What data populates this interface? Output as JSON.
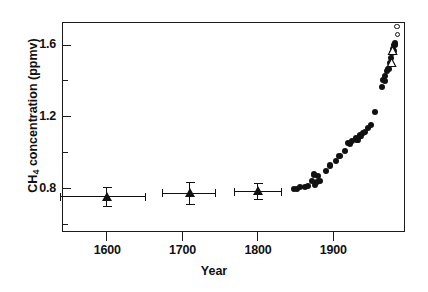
{
  "chart_data": {
    "type": "scatter",
    "title": "",
    "xlabel": "Year",
    "ylabel": "CH4 concentration (ppmv)",
    "ylabel_prefix": "CH",
    "ylabel_subscript": "4",
    "ylabel_suffix": " concentration (ppmv)",
    "xlim": [
      1540,
      1995
    ],
    "ylim": [
      0.56,
      1.73
    ],
    "grid": false,
    "legend": "none",
    "x_major_ticks": [
      1600,
      1700,
      1800,
      1900
    ],
    "x_tick_labels": [
      "1600",
      "1700",
      "1800",
      "1900"
    ],
    "y_major_ticks": [
      0.8,
      1.2,
      1.6
    ],
    "y_tick_labels": [
      "0.8",
      "1.2",
      "1.6"
    ],
    "y_minor_ticks": [
      0.6,
      1.0,
      1.4
    ],
    "axis_color": "#1b1b1b",
    "marker_color": "#111111",
    "background": "#ffffff",
    "series": [
      {
        "name": "ice-core-samples",
        "marker": "filled-triangle",
        "points": [
          {
            "x": 1600,
            "y": 0.755,
            "xerr_low": 62,
            "xerr_high": 51,
            "yerr_low": 0.052,
            "yerr_high": 0.052
          },
          {
            "x": 1710,
            "y": 0.775,
            "xerr_low": 37,
            "xerr_high": 34,
            "yerr_low": 0.062,
            "yerr_high": 0.062
          },
          {
            "x": 1800,
            "y": 0.785,
            "xerr_low": 31,
            "xerr_high": 31,
            "yerr_low": 0.044,
            "yerr_high": 0.044
          }
        ]
      },
      {
        "name": "ice-core-and-atmospheric-record",
        "marker": "filled-circle",
        "points": [
          {
            "x": 1848,
            "y": 0.8
          },
          {
            "x": 1852,
            "y": 0.798
          },
          {
            "x": 1856,
            "y": 0.81
          },
          {
            "x": 1862,
            "y": 0.812
          },
          {
            "x": 1866,
            "y": 0.818
          },
          {
            "x": 1872,
            "y": 0.845
          },
          {
            "x": 1874,
            "y": 0.88
          },
          {
            "x": 1876,
            "y": 0.822
          },
          {
            "x": 1878,
            "y": 0.838
          },
          {
            "x": 1880,
            "y": 0.87
          },
          {
            "x": 1882,
            "y": 0.845
          },
          {
            "x": 1890,
            "y": 0.9
          },
          {
            "x": 1896,
            "y": 0.93
          },
          {
            "x": 1903,
            "y": 0.955
          },
          {
            "x": 1908,
            "y": 0.985
          },
          {
            "x": 1915,
            "y": 1.01
          },
          {
            "x": 1919,
            "y": 1.055
          },
          {
            "x": 1922,
            "y": 1.048
          },
          {
            "x": 1925,
            "y": 1.068
          },
          {
            "x": 1930,
            "y": 1.085
          },
          {
            "x": 1932,
            "y": 1.075
          },
          {
            "x": 1936,
            "y": 1.098
          },
          {
            "x": 1939,
            "y": 1.11
          },
          {
            "x": 1942,
            "y": 1.118
          },
          {
            "x": 1946,
            "y": 1.14
          },
          {
            "x": 1950,
            "y": 1.155
          },
          {
            "x": 1955,
            "y": 1.23
          },
          {
            "x": 1964,
            "y": 1.37
          },
          {
            "x": 1966,
            "y": 1.405
          },
          {
            "x": 1968,
            "y": 1.4
          },
          {
            "x": 1969,
            "y": 1.43
          },
          {
            "x": 1971,
            "y": 1.455
          },
          {
            "x": 1973,
            "y": 1.47
          },
          {
            "x": 1975,
            "y": 1.5
          },
          {
            "x": 1976,
            "y": 1.53
          },
          {
            "x": 1978,
            "y": 1.555
          },
          {
            "x": 1979,
            "y": 1.58
          },
          {
            "x": 1980,
            "y": 1.57
          },
          {
            "x": 1981,
            "y": 1.6
          },
          {
            "x": 1982,
            "y": 1.61
          }
        ]
      },
      {
        "name": "open-triangle-samples",
        "marker": "open-triangle",
        "points": [
          {
            "x": 1977,
            "y": 1.505
          },
          {
            "x": 1978,
            "y": 1.57
          }
        ]
      },
      {
        "name": "modern-atmospheric-measurements",
        "marker": "open-circle",
        "points": [
          {
            "x": 1984,
            "y": 1.705
          },
          {
            "x": 1985,
            "y": 1.66
          }
        ]
      }
    ]
  }
}
